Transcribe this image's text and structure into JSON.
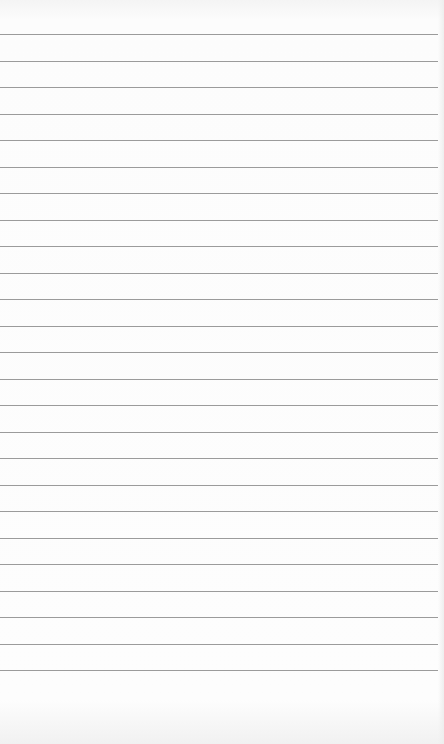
{
  "notepad": {
    "type": "lined-paper",
    "line_count": 25,
    "first_line_y": 34,
    "line_spacing": 26.5,
    "line_color": "#8a8a8a",
    "paper_color": "#fdfdfd"
  }
}
